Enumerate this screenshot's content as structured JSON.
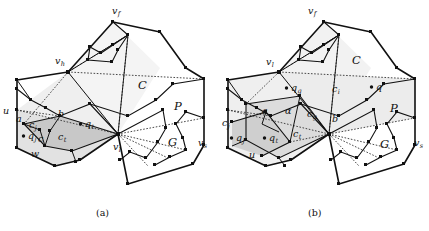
{
  "figure": {
    "type": "geometry-diagram-pair",
    "captions": [
      {
        "key": "a",
        "text": "(a)"
      },
      {
        "key": "b",
        "text": "(b)"
      }
    ],
    "colors": {
      "background": "#ffffff",
      "stroke": "#111111",
      "polygon_fill": "#ffffff",
      "light_shade": "#ececec",
      "mid_shade": "#dcdcdc",
      "dark_shade": "#c4c4c4",
      "dotted_stroke": "#333333"
    },
    "panels": [
      {
        "id": "a",
        "caption": "(a)",
        "labels": [
          {
            "name": "v-f",
            "base": "v",
            "sub": "f",
            "x": 112,
            "y": 14,
            "style": "lbl"
          },
          {
            "name": "v-h",
            "base": "v",
            "sub": "h",
            "x": 55,
            "y": 64,
            "style": "lbl"
          },
          {
            "name": "v-l",
            "base": "v",
            "sub": "l",
            "x": 113,
            "y": 150,
            "style": "lbl"
          },
          {
            "name": "v-s",
            "base": "v",
            "sub": "s",
            "x": 198,
            "y": 146,
            "style": "lbl"
          },
          {
            "name": "u",
            "base": "u",
            "sub": "",
            "x": 3,
            "y": 114,
            "style": "lbl"
          },
          {
            "name": "a",
            "base": "a",
            "sub": "",
            "x": 16,
            "y": 122,
            "style": "lbl"
          },
          {
            "name": "b",
            "base": "b",
            "sub": "",
            "x": 58,
            "y": 117,
            "style": "lbl"
          },
          {
            "name": "c",
            "base": "c",
            "sub": "",
            "x": 38,
            "y": 142,
            "style": "lbl"
          },
          {
            "name": "c-j",
            "base": "c",
            "sub": "j",
            "x": 29,
            "y": 128,
            "style": "lbl"
          },
          {
            "name": "c-t",
            "base": "c",
            "sub": "t",
            "x": 58,
            "y": 140,
            "style": "lbl"
          },
          {
            "name": "q-j",
            "base": "q",
            "sub": "j",
            "x": 28,
            "y": 139,
            "style": "lbl",
            "dot": true
          },
          {
            "name": "q-t",
            "base": "q",
            "sub": "t",
            "x": 85,
            "y": 127,
            "style": "lbl",
            "dot": true
          },
          {
            "name": "w",
            "base": "w",
            "sub": "",
            "x": 31,
            "y": 157,
            "style": "lbl"
          },
          {
            "name": "C",
            "base": "C",
            "sub": "",
            "x": 138,
            "y": 89,
            "style": "lbl-big"
          },
          {
            "name": "P",
            "base": "P",
            "sub": "",
            "x": 174,
            "y": 110,
            "style": "lbl-big"
          },
          {
            "name": "G",
            "base": "G",
            "sub": "",
            "x": 168,
            "y": 146,
            "style": "lbl-big"
          }
        ]
      },
      {
        "id": "b",
        "caption": "(b)",
        "labels": [
          {
            "name": "v-f",
            "base": "v",
            "sub": "f",
            "x": 308,
            "y": 14,
            "style": "lbl"
          },
          {
            "name": "v-l",
            "base": "v",
            "sub": "l",
            "x": 266,
            "y": 65,
            "style": "lbl"
          },
          {
            "name": "v-s",
            "base": "v",
            "sub": "s",
            "x": 414,
            "y": 146,
            "style": "lbl"
          },
          {
            "name": "u",
            "base": "u",
            "sub": "",
            "x": 249,
            "y": 158,
            "style": "lbl"
          },
          {
            "name": "a",
            "base": "a",
            "sub": "",
            "x": 262,
            "y": 114,
            "style": "lbl"
          },
          {
            "name": "b",
            "base": "b",
            "sub": "",
            "x": 332,
            "y": 122,
            "style": "lbl"
          },
          {
            "name": "alpha",
            "base": "α",
            "sub": "",
            "x": 285,
            "y": 114,
            "style": "lbl"
          },
          {
            "name": "c-j",
            "base": "c",
            "sub": "j",
            "x": 222,
            "y": 126,
            "style": "lbl"
          },
          {
            "name": "c-g",
            "base": "c",
            "sub": "g",
            "x": 307,
            "y": 117,
            "style": "lbl"
          },
          {
            "name": "c-t",
            "base": "c",
            "sub": "t",
            "x": 293,
            "y": 137,
            "style": "lbl"
          },
          {
            "name": "c-i",
            "base": "c",
            "sub": "i",
            "x": 332,
            "y": 92,
            "style": "lbl"
          },
          {
            "name": "q-j",
            "base": "q",
            "sub": "j",
            "x": 236,
            "y": 141,
            "style": "lbl",
            "dot": true
          },
          {
            "name": "q-t",
            "base": "q",
            "sub": "t",
            "x": 269,
            "y": 141,
            "style": "lbl",
            "dot": true
          },
          {
            "name": "q-g",
            "base": "q",
            "sub": "g",
            "x": 291,
            "y": 91,
            "style": "lbl",
            "dot": true
          },
          {
            "name": "q",
            "base": "q",
            "sub": "",
            "x": 376,
            "y": 90,
            "style": "lbl",
            "dot": true
          },
          {
            "name": "C",
            "base": "C",
            "sub": "",
            "x": 352,
            "y": 64,
            "style": "lbl-big"
          },
          {
            "name": "P",
            "base": "P",
            "sub": "",
            "x": 390,
            "y": 112,
            "style": "lbl-big"
          },
          {
            "name": "G",
            "base": "G",
            "sub": "",
            "x": 380,
            "y": 148,
            "style": "lbl-big"
          }
        ]
      }
    ]
  }
}
